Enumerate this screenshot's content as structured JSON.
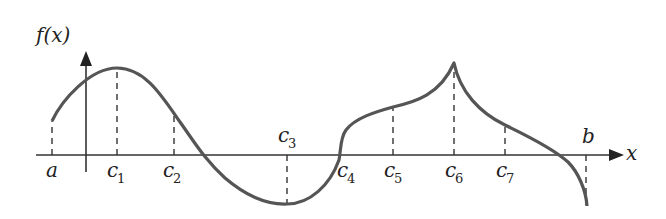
{
  "diagram": {
    "y_axis_label": "f(x)",
    "x_axis_label": "x",
    "points": [
      {
        "name": "a",
        "label": "a",
        "sub": ""
      },
      {
        "name": "c1",
        "label": "c",
        "sub": "1"
      },
      {
        "name": "c2",
        "label": "c",
        "sub": "2"
      },
      {
        "name": "c3",
        "label": "c",
        "sub": "3"
      },
      {
        "name": "c4",
        "label": "c",
        "sub": "4"
      },
      {
        "name": "c5",
        "label": "c",
        "sub": "5"
      },
      {
        "name": "c6",
        "label": "c",
        "sub": "6"
      },
      {
        "name": "c7",
        "label": "c",
        "sub": "7"
      },
      {
        "name": "b",
        "label": "b",
        "sub": ""
      }
    ],
    "colors": {
      "curve": "#555555",
      "axis": "#333333"
    }
  }
}
